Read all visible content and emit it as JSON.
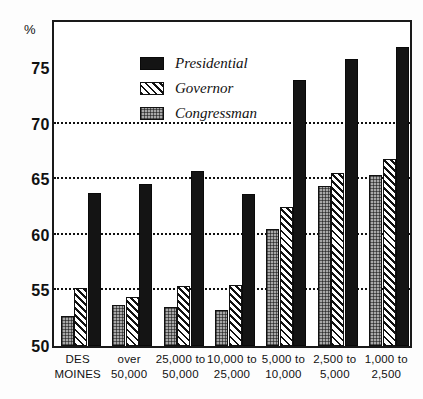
{
  "axis": {
    "y_unit_symbol": "%",
    "y_ticks": [
      "75",
      "70",
      "65",
      "60",
      "55",
      "50"
    ],
    "y_min": 50,
    "y_max": 79.5,
    "gridline_values": [
      70,
      65,
      60,
      55
    ]
  },
  "legend": {
    "items": [
      {
        "label": "Presidential",
        "key": "presidential",
        "swatch": "solid-black-swatch",
        "color": "#141414"
      },
      {
        "label": "Governor",
        "key": "governor",
        "swatch": "diagonal-hatch-swatch",
        "color": "#111111"
      },
      {
        "label": "Congressman",
        "key": "congressman",
        "swatch": "gray-stipple-swatch",
        "color": "#a8a8a8"
      }
    ]
  },
  "categories": [
    {
      "line1": "DES",
      "line2": "MOINES"
    },
    {
      "line1": "over",
      "line2": "50,000"
    },
    {
      "line1": "25,000 to",
      "line2": "50,000"
    },
    {
      "line1": "10,000 to",
      "line2": "25,000"
    },
    {
      "line1": "5,000 to",
      "line2": "10,000"
    },
    {
      "line1": "2,500 to",
      "line2": "5,000"
    },
    {
      "line1": "1,000 to",
      "line2": "2,500"
    }
  ],
  "chart_data": {
    "type": "bar",
    "title": "",
    "xlabel": "",
    "ylabel": "%",
    "ylim": [
      50,
      79.5
    ],
    "grid": true,
    "legend_position": "top-left",
    "categories": [
      "DES MOINES",
      "over 50,000",
      "25,000 to 50,000",
      "10,000 to 25,000",
      "5,000 to 10,000",
      "2,500 to 5,000",
      "1,000 to 2,500"
    ],
    "series": [
      {
        "name": "Congressman",
        "values": [
          52.7,
          53.7,
          53.5,
          53.2,
          60.5,
          64.4,
          65.4
        ]
      },
      {
        "name": "Governor",
        "values": [
          55.2,
          54.4,
          55.4,
          55.5,
          62.5,
          65.6,
          66.8
        ]
      },
      {
        "name": "Presidential",
        "values": [
          63.8,
          64.6,
          65.7,
          63.7,
          73.9,
          75.8,
          76.9
        ]
      }
    ],
    "y_tick_labels": [
      "50",
      "55",
      "60",
      "65",
      "70",
      "75"
    ],
    "gridlines_at": [
      55,
      60,
      65,
      70
    ]
  }
}
